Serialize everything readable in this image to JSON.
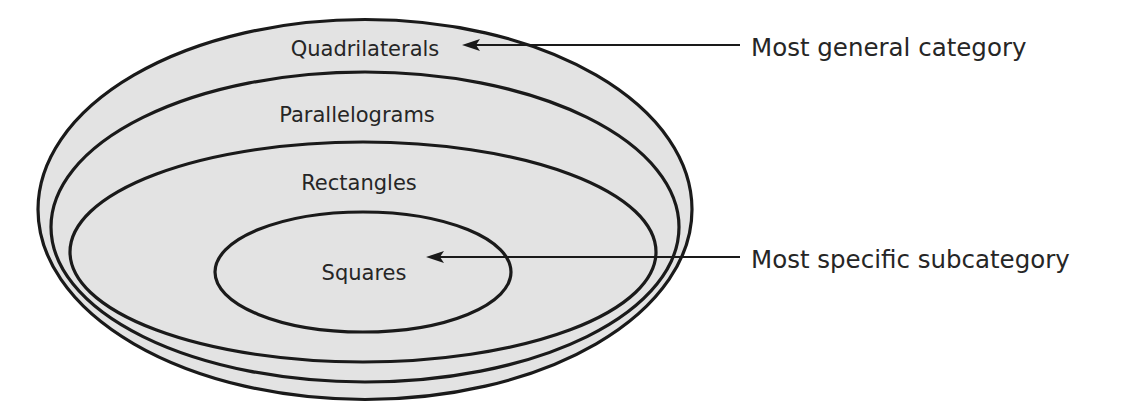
{
  "diagram": {
    "type": "nested-set (Euler) diagram",
    "colors": {
      "fill": "#e3e3e3",
      "stroke": "#1a1a1a",
      "text": "#262626",
      "background": "#ffffff"
    },
    "sets": [
      {
        "label": "Quadrilaterals",
        "level": 1
      },
      {
        "label": "Parallelograms",
        "level": 2
      },
      {
        "label": "Rectangles",
        "level": 3
      },
      {
        "label": "Squares",
        "level": 4
      }
    ],
    "callouts": [
      {
        "label": "Most general category",
        "points_to": "Quadrilaterals"
      },
      {
        "label": "Most specific subcategory",
        "points_to": "Squares"
      }
    ]
  }
}
